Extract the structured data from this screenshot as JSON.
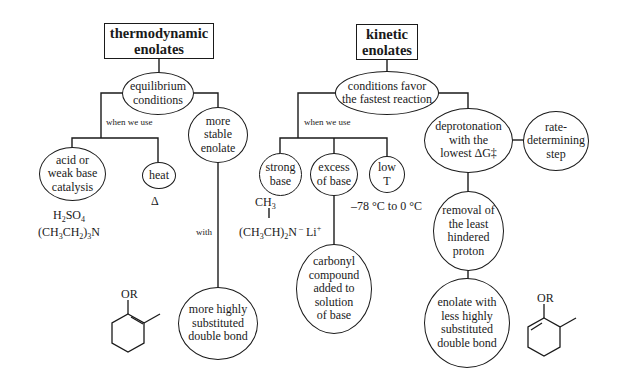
{
  "thermo": {
    "title": [
      "thermodynamic",
      "enolates"
    ],
    "root_condition": [
      "equilibrium",
      "conditions"
    ],
    "when_label": "when we use",
    "use_items": [
      {
        "lines": [
          "acid or",
          "weak base",
          "catalysis"
        ]
      },
      {
        "lines": [
          "heat"
        ]
      }
    ],
    "catalysts": [
      "H2SO4",
      "(CH3CH2)3N"
    ],
    "heat_symbol": "Δ",
    "result": [
      "more",
      "stable",
      "enolate"
    ],
    "with_label": "with",
    "outcome": [
      "more highly",
      "substituted",
      "double bond"
    ],
    "structure_label": "OR"
  },
  "kinetic": {
    "title": [
      "kinetic",
      "enolates"
    ],
    "root_condition": [
      "conditions favor",
      "the fastest reaction"
    ],
    "when_label": "when we use",
    "use_items": [
      {
        "lines": [
          "strong",
          "base"
        ]
      },
      {
        "lines": [
          "excess",
          "of base"
        ]
      },
      {
        "lines": [
          "low",
          "T"
        ]
      }
    ],
    "base_formula": {
      "top": "CH3",
      "bottom": "(CH3CH)2N – Li+"
    },
    "temperature": "–78 °C to 0 °C",
    "excess_result": [
      "carbonyl",
      "compound",
      "added to",
      "solution",
      "of base"
    ],
    "deprotonation": [
      "deprotonation",
      "with the",
      "lowest ΔG‡"
    ],
    "rate_step": [
      "rate-",
      "determining",
      "step"
    ],
    "removal": [
      "removal of",
      "the least",
      "hindered",
      "proton"
    ],
    "outcome": [
      "enolate with",
      "less highly",
      "substituted",
      "double bond"
    ],
    "structure_label": "OR"
  }
}
